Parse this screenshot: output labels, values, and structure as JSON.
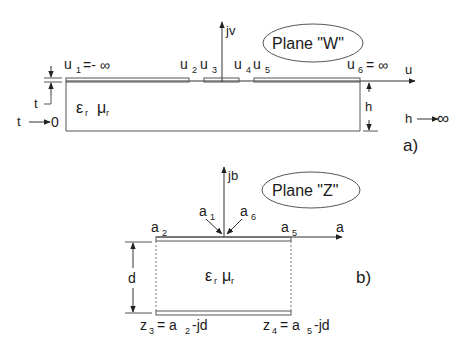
{
  "diagram_a": {
    "caption": "a)",
    "plane_label": "Plane \"W\"",
    "axis_v": "jv",
    "axis_u": "u",
    "u1_base": "u",
    "u1_sub": "1",
    "u1_val": "=- ∞",
    "u2_base": "u",
    "u2_sub": "2",
    "u3_base": "u",
    "u3_sub": "3",
    "u4_base": "u",
    "u4_sub": "4",
    "u5_base": "u",
    "u5_sub": "5",
    "u6_base": "u",
    "u6_sub": "6",
    "u6_val": "= ∞",
    "eps": "ε",
    "eps_sub": "r",
    "mu": "μ",
    "mu_sub": "r",
    "t_label": "t",
    "t_limit_left": "t",
    "t_limit_right": "0",
    "h_label": "h",
    "h_limit_left": "h",
    "h_limit_right": "∞"
  },
  "diagram_b": {
    "caption": "b)",
    "plane_label": "Plane \"Z\"",
    "axis_b": "jb",
    "axis_a": "a",
    "a1_base": "a",
    "a1_sub": "1",
    "a6_base": "a",
    "a6_sub": "6",
    "a2_base": "a",
    "a2_sub": "2",
    "a5_base": "a",
    "a5_sub": "5",
    "eps": "ε",
    "eps_sub": "r",
    "mu": "μ",
    "mu_sub": "r",
    "d_label": "d",
    "z3_base": "z",
    "z3_sub": "3",
    "z3_eq": "= a",
    "z3_eq_sub": "2",
    "z3_tail": "-jd",
    "z4_base": "z",
    "z4_sub": "4",
    "z4_eq": "= a",
    "z4_eq_sub": "5",
    "z4_tail": "-jd"
  }
}
